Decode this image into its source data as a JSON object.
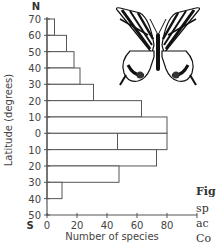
{
  "chart_data": {
    "type": "bar",
    "orientation": "horizontal",
    "title": "",
    "xlabel": "Number of species",
    "ylabel": "Latitude (degrees)",
    "xlim": [
      0,
      100
    ],
    "xticks": [
      0,
      20,
      40,
      60,
      80
    ],
    "ylim_labels": [
      "70",
      "60",
      "50",
      "40",
      "30",
      "20",
      "10",
      "0",
      "10",
      "20",
      "30",
      "40",
      "50"
    ],
    "y_top_marker": "N",
    "y_bottom_marker": "S",
    "grid": false,
    "categories": [
      "70N-60N",
      "60N-50N",
      "50N-40N",
      "40N-30N",
      "30N-20N",
      "20N-10N",
      "10N-0",
      "0-10S",
      "10S-20S",
      "20S-30S",
      "30S-40S",
      "40S-50S"
    ],
    "values": [
      5,
      13,
      18,
      22,
      31,
      63,
      80,
      80,
      73,
      48,
      10,
      0
    ],
    "extra_divider": {
      "band": "0-10S",
      "value": 47
    },
    "bar_color": "#ffffff",
    "line_color": "#555555"
  },
  "caption": {
    "lines": [
      "Fig",
      "sp",
      "ac",
      "Co"
    ]
  },
  "illustration": {
    "name": "swallowtail butterfly"
  }
}
